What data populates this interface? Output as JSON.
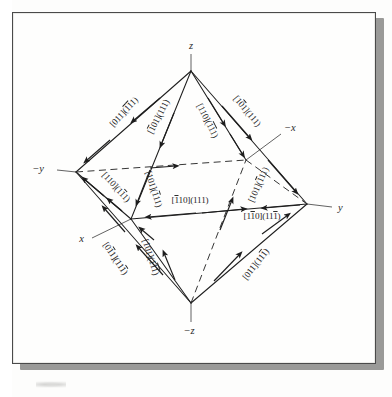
{
  "figure": {
    "type": "octahedron-slip-system-diagram",
    "axes": [
      {
        "name": "z-axis-label",
        "text": "z",
        "x": 191,
        "y": 46
      },
      {
        "name": "neg-z-axis-label",
        "text": "−z",
        "x": 186,
        "y": 331
      },
      {
        "name": "y-axis-label",
        "text": "y",
        "x": 336,
        "y": 208
      },
      {
        "name": "neg-y-axis-label",
        "text": "−y",
        "x": 46,
        "y": 167
      },
      {
        "name": "x-axis-label",
        "text": "x",
        "x": 83,
        "y": 239
      },
      {
        "name": "neg-x-axis-label",
        "text": "−x",
        "x": 282,
        "y": 129
      }
    ],
    "slip_systems": [
      {
        "name": "slip-label-1",
        "direction": "[011]",
        "plane": "(111)",
        "dir_bars": [],
        "plane_bars": [
          1,
          2
        ],
        "x": 126,
        "y": 114,
        "rot": -47
      },
      {
        "name": "slip-label-2",
        "direction": "[101]",
        "plane": "(111)",
        "dir_bars": [
          1
        ],
        "plane_bars": [],
        "x": 161,
        "y": 118,
        "rot": -63
      },
      {
        "name": "slip-label-3",
        "direction": "[110]",
        "plane": "(111)",
        "dir_bars": [],
        "plane_bars": [
          1,
          2
        ],
        "x": 205,
        "y": 122,
        "rot": 63
      },
      {
        "name": "slip-label-4",
        "direction": "[101]",
        "plane": "(111)",
        "dir_bars": [
          2
        ],
        "plane_bars": [],
        "x": 245,
        "y": 113,
        "rot": 50
      },
      {
        "name": "slip-label-5",
        "direction": "[110]",
        "plane": "(111)",
        "dir_bars": [],
        "plane_bars": [
          2
        ],
        "x": 114,
        "y": 189,
        "rot": 47
      },
      {
        "name": "slip-label-6",
        "direction": "[101]",
        "plane": "(111)",
        "dir_bars": [],
        "plane_bars": [
          1
        ],
        "x": 151,
        "y": 190,
        "rot": 72
      },
      {
        "name": "slip-label-7",
        "direction": "[110]",
        "plane": "(111)",
        "dir_bars": [
          1
        ],
        "plane_bars": [],
        "x": 190,
        "y": 203,
        "rot": 0
      },
      {
        "name": "slip-label-8",
        "direction": "[101]",
        "plane": "(111)",
        "dir_bars": [],
        "plane_bars": [
          1
        ],
        "x": 261,
        "y": 186,
        "rot": -66
      },
      {
        "name": "slip-label-9",
        "direction": "[110]",
        "plane": "(111)",
        "dir_bars": [
          2
        ],
        "plane_bars": [
          3
        ],
        "x": 262,
        "y": 219,
        "rot": 0
      },
      {
        "name": "slip-label-10",
        "direction": "[011]",
        "plane": "(111)",
        "dir_bars": [
          2
        ],
        "plane_bars": [
          3
        ],
        "x": 113,
        "y": 260,
        "rot": 56
      },
      {
        "name": "slip-label-11",
        "direction": "[101]",
        "plane": "(111)",
        "dir_bars": [],
        "plane_bars": [
          2,
          3
        ],
        "x": 148,
        "y": 258,
        "rot": 72
      },
      {
        "name": "slip-label-12",
        "direction": "[011]",
        "plane": "(111)",
        "dir_bars": [],
        "plane_bars": [
          3
        ],
        "x": 258,
        "y": 266,
        "rot": -52
      }
    ],
    "colors": {
      "ink": "#1d1d1d",
      "line": "#2b2b2b",
      "paper": "#fefefd",
      "shadow": "#9a9a98",
      "frame": "#4a4a4a"
    }
  }
}
